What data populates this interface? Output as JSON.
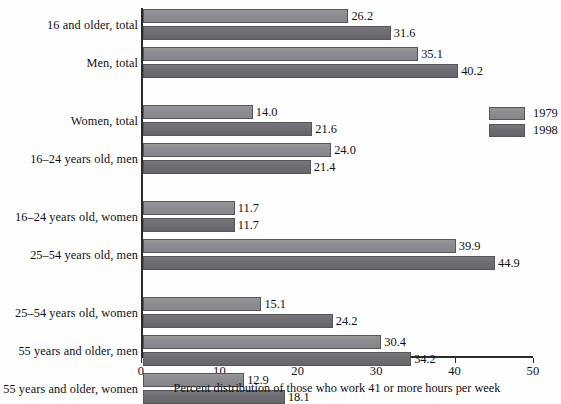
{
  "chart_data": {
    "type": "bar",
    "orientation": "horizontal",
    "title": "",
    "xlabel": "Percent distribution of those who work 41 or more hours per week",
    "ylabel": "",
    "xlim": [
      0,
      50
    ],
    "xticks": [
      0,
      10,
      20,
      30,
      40,
      50
    ],
    "xtick_labels": [
      "0",
      "10",
      "20",
      "30",
      "40",
      "50"
    ],
    "grid": false,
    "legend_position": "right",
    "categories": [
      "16 and older, total",
      "Men, total",
      "Women, total",
      "16–24 years old, men",
      "16–24 years old, women",
      "25–54 years old, men",
      "25–54 years old, women",
      "55 years and older, men",
      "55 years and older, women"
    ],
    "group_breaks_after": [
      2,
      4,
      6
    ],
    "series": [
      {
        "name": "1979",
        "color": "#8d8d92",
        "values": [
          26.2,
          35.1,
          14.0,
          24.0,
          11.7,
          39.9,
          15.1,
          30.4,
          12.9
        ],
        "labels": [
          "26.2",
          "35.1",
          "14.0",
          "24.0",
          "11.7",
          "39.9",
          "15.1",
          "30.4",
          "12.9"
        ]
      },
      {
        "name": "1998",
        "color": "#6e6e74",
        "values": [
          31.6,
          40.2,
          21.6,
          21.4,
          11.7,
          44.9,
          24.2,
          34.2,
          18.1
        ],
        "labels": [
          "31.6",
          "40.2",
          "21.6",
          "21.4",
          "11.7",
          "44.9",
          "24.2",
          "34.2",
          "18.1"
        ]
      }
    ]
  },
  "legend": {
    "entries": [
      {
        "label": "1979"
      },
      {
        "label": "1998"
      }
    ]
  }
}
